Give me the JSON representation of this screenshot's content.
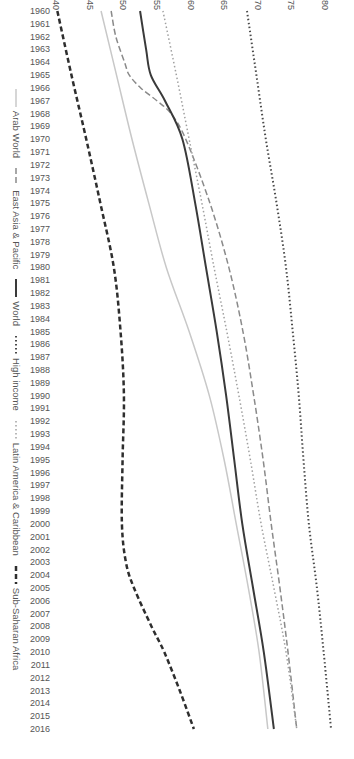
{
  "chart_data": {
    "type": "line",
    "title": "",
    "xlabel": "",
    "ylabel": "",
    "ylim": [
      40,
      80
    ],
    "yticks": [
      40,
      45,
      50,
      55,
      60,
      65,
      70,
      75,
      80
    ],
    "grid": false,
    "legend_position": "bottom",
    "orientation_note": "Rendered rotated 90 degrees clockwise",
    "x": [
      1960,
      1961,
      1962,
      1963,
      1964,
      1965,
      1966,
      1967,
      1968,
      1969,
      1970,
      1971,
      1972,
      1973,
      1974,
      1975,
      1976,
      1977,
      1978,
      1979,
      1980,
      1981,
      1982,
      1983,
      1984,
      1985,
      1986,
      1987,
      1988,
      1989,
      1990,
      1991,
      1992,
      1993,
      1994,
      1995,
      1996,
      1997,
      1998,
      1999,
      2000,
      2001,
      2002,
      2003,
      2004,
      2005,
      2006,
      2007,
      2008,
      2009,
      2010,
      2011,
      2012,
      2013,
      2014,
      2015,
      2016
    ],
    "key_years": [
      1960,
      1965,
      1968,
      1970,
      1980,
      1990,
      2000,
      2005,
      2010,
      2016
    ],
    "series": [
      {
        "name": "Arab World",
        "style": "solid",
        "color": "#c8c8c8",
        "width": 1.5,
        "points": [
          [
            1960,
            46.7
          ],
          [
            1965,
            49.0
          ],
          [
            1970,
            51.3
          ],
          [
            1975,
            53.8
          ],
          [
            1980,
            56.4
          ],
          [
            1985,
            59.8
          ],
          [
            1990,
            62.8
          ],
          [
            1995,
            65.0
          ],
          [
            2000,
            66.8
          ],
          [
            2005,
            68.6
          ],
          [
            2010,
            70.2
          ],
          [
            2016,
            71.5
          ]
        ]
      },
      {
        "name": "East Asia & Pacific",
        "style": "dashed",
        "color": "#8a8a8a",
        "width": 1.5,
        "points": [
          [
            1960,
            48.2
          ],
          [
            1962,
            48.9
          ],
          [
            1964,
            50.2
          ],
          [
            1965,
            50.9
          ],
          [
            1966,
            52.6
          ],
          [
            1967,
            55.0
          ],
          [
            1968,
            57.1
          ],
          [
            1970,
            59.3
          ],
          [
            1975,
            62.9
          ],
          [
            1980,
            65.7
          ],
          [
            1985,
            67.8
          ],
          [
            1990,
            69.4
          ],
          [
            1995,
            70.8
          ],
          [
            2000,
            72.0
          ],
          [
            2005,
            73.3
          ],
          [
            2010,
            74.5
          ],
          [
            2016,
            75.8
          ]
        ]
      },
      {
        "name": "World",
        "style": "solid",
        "color": "#3a3a3a",
        "width": 2,
        "points": [
          [
            1960,
            52.5
          ],
          [
            1963,
            53.4
          ],
          [
            1965,
            54.1
          ],
          [
            1967,
            56.2
          ],
          [
            1970,
            58.8
          ],
          [
            1975,
            60.7
          ],
          [
            1980,
            62.3
          ],
          [
            1985,
            63.9
          ],
          [
            1990,
            65.3
          ],
          [
            1995,
            66.5
          ],
          [
            2000,
            67.7
          ],
          [
            2005,
            69.3
          ],
          [
            2010,
            70.9
          ],
          [
            2016,
            72.4
          ]
        ]
      },
      {
        "name": "High income",
        "style": "dotted",
        "color": "#4a4a4a",
        "width": 2,
        "points": [
          [
            1960,
            68.4
          ],
          [
            1965,
            69.8
          ],
          [
            1970,
            71.2
          ],
          [
            1975,
            72.8
          ],
          [
            1980,
            74.2
          ],
          [
            1985,
            75.2
          ],
          [
            1990,
            76.1
          ],
          [
            1995,
            76.8
          ],
          [
            2000,
            77.6
          ],
          [
            2005,
            78.8
          ],
          [
            2010,
            79.8
          ],
          [
            2016,
            80.9
          ]
        ]
      },
      {
        "name": "Latin America & Caribbean",
        "style": "dotted",
        "color": "#a0a0a0",
        "width": 1.5,
        "points": [
          [
            1960,
            55.9
          ],
          [
            1965,
            57.9
          ],
          [
            1970,
            59.8
          ],
          [
            1975,
            61.7
          ],
          [
            1980,
            63.5
          ],
          [
            1985,
            65.4
          ],
          [
            1990,
            67.2
          ],
          [
            1995,
            68.9
          ],
          [
            2000,
            70.5
          ],
          [
            2005,
            72.4
          ],
          [
            2010,
            74.2
          ],
          [
            2016,
            75.8
          ]
        ]
      },
      {
        "name": "Sub-Saharan Africa",
        "style": "dashed-bold",
        "color": "#2e2e2e",
        "width": 2.5,
        "points": [
          [
            1960,
            40.2
          ],
          [
            1965,
            42.3
          ],
          [
            1970,
            44.5
          ],
          [
            1975,
            46.6
          ],
          [
            1980,
            48.6
          ],
          [
            1985,
            49.6
          ],
          [
            1990,
            50.1
          ],
          [
            1995,
            49.9
          ],
          [
            2000,
            49.8
          ],
          [
            2003,
            50.4
          ],
          [
            2005,
            51.6
          ],
          [
            2008,
            54.2
          ],
          [
            2010,
            56.1
          ],
          [
            2013,
            58.4
          ],
          [
            2016,
            60.5
          ]
        ]
      }
    ]
  },
  "legend": {
    "items": [
      {
        "label": "Arab World"
      },
      {
        "label": "East Asia & Pacific"
      },
      {
        "label": "World"
      },
      {
        "label": "High income"
      },
      {
        "label": "Latin America & Caribbean"
      },
      {
        "label": "Sub-Saharan Africa"
      }
    ]
  }
}
